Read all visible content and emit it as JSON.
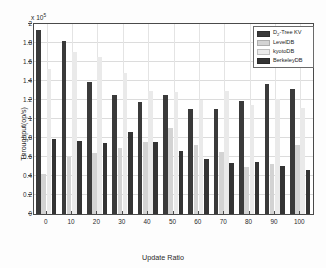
{
  "chart_data": {
    "type": "bar",
    "title": "",
    "xlabel": "Update Ratio",
    "ylabel": "Throughput(op/s)",
    "y_multiplier": "x 10",
    "y_multiplier_exponent": "5",
    "categories": [
      "0",
      "10",
      "20",
      "30",
      "40",
      "50",
      "60",
      "70",
      "80",
      "90",
      "100"
    ],
    "ylim": [
      0,
      2
    ],
    "ytick_labels": [
      "0",
      "0.2",
      "0.4",
      "0.6",
      "0.8",
      "1",
      "1.2",
      "1.4",
      "1.6",
      "1.8",
      "2"
    ],
    "ytick_values": [
      0,
      0.2,
      0.4,
      0.6,
      0.8,
      1,
      1.2,
      1.4,
      1.6,
      1.8,
      2
    ],
    "grid": true,
    "legend_position": "top-right",
    "series": [
      {
        "name": "D2-Tree KV",
        "label_main": "D",
        "label_sub": "2",
        "label_tail": "-Tree KV",
        "color": "#3a3a3a",
        "values": [
          1.94,
          1.82,
          1.385,
          1.25,
          1.175,
          1.255,
          1.105,
          1.105,
          1.19,
          1.365,
          1.32
        ]
      },
      {
        "name": "LevelDB",
        "label_main": "LevelDB",
        "label_sub": "",
        "label_tail": "",
        "color": "#d3d3d3",
        "values": [
          0.42,
          0.6,
          0.645,
          0.69,
          0.755,
          0.905,
          0.73,
          0.655,
          0.49,
          0.53,
          0.73
        ]
      },
      {
        "name": "kyotoDB",
        "label_main": "kyotoDB",
        "label_sub": "",
        "label_tail": "",
        "color": "#eaeaea",
        "values": [
          1.53,
          1.71,
          1.65,
          1.48,
          1.3,
          1.285,
          1.2,
          1.3,
          1.145,
          1.21,
          1.12
        ]
      },
      {
        "name": "BerkeleyDB",
        "label_main": "BerkeleyDB",
        "label_sub": "",
        "label_tail": "",
        "color": "#343434",
        "values": [
          0.79,
          0.77,
          0.75,
          0.865,
          0.76,
          0.66,
          0.58,
          0.535,
          0.55,
          0.51,
          0.46
        ]
      }
    ]
  }
}
